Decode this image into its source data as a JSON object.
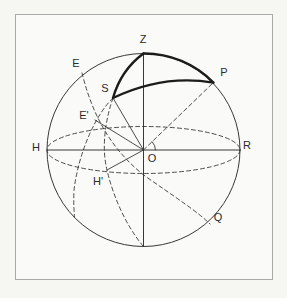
{
  "figure": {
    "labels": {
      "zenith": "Z",
      "equator_upper": "E",
      "pole": "P",
      "star": "S",
      "equator_foot": "E'",
      "horizon_left": "H",
      "center": "O",
      "horizon_right": "R",
      "horizon_foot": "H'",
      "equator_lower": "Q"
    },
    "colors": {
      "line": "#383836",
      "bold_line": "#1c1c1a",
      "frame": "#a9a9a7",
      "paper": "#fafaf8",
      "background": "#f6f6f3"
    }
  }
}
